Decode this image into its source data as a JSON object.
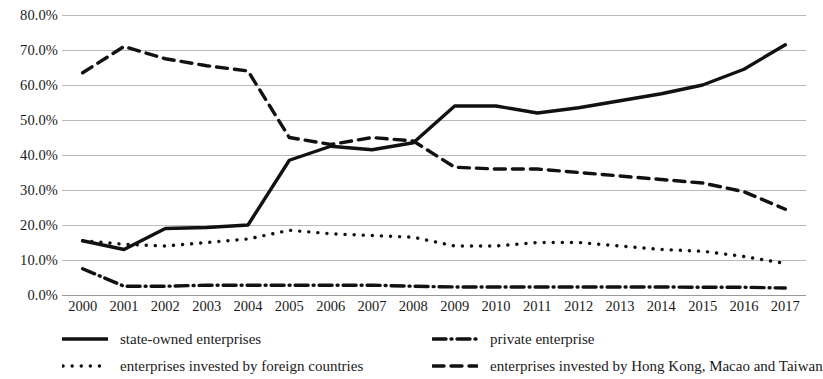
{
  "chart_data": {
    "type": "line",
    "title": "",
    "xlabel": "",
    "ylabel": "",
    "ylim": [
      0,
      80
    ],
    "ytick_step": 10,
    "grid": true,
    "legend_position": "bottom",
    "y_ticks": [
      "0.0%",
      "10.0%",
      "20.0%",
      "30.0%",
      "40.0%",
      "50.0%",
      "60.0%",
      "70.0%",
      "80.0%"
    ],
    "categories": [
      "2000",
      "2001",
      "2002",
      "2003",
      "2004",
      "2005",
      "2006",
      "2007",
      "2008",
      "2009",
      "2010",
      "2011",
      "2012",
      "2013",
      "2014",
      "2015",
      "2016",
      "2017"
    ],
    "series": [
      {
        "name": "state-owned enterprises",
        "style": "solid",
        "color": "#111111",
        "values": [
          15.5,
          13.0,
          19.0,
          19.3,
          20.0,
          38.5,
          42.5,
          41.5,
          43.5,
          54.0,
          54.0,
          52.0,
          53.5,
          55.5,
          57.5,
          60.0,
          64.5,
          71.5
        ]
      },
      {
        "name": "private enterprise",
        "style": "dash-dot",
        "color": "#111111",
        "values": [
          7.5,
          2.5,
          2.5,
          2.8,
          2.8,
          2.8,
          2.8,
          2.8,
          2.5,
          2.3,
          2.3,
          2.3,
          2.3,
          2.3,
          2.3,
          2.2,
          2.2,
          2.0
        ]
      },
      {
        "name": "enterprises invested by foreign countries",
        "style": "dotted",
        "color": "#111111",
        "values": [
          15.5,
          14.5,
          14.0,
          15.0,
          16.0,
          18.5,
          17.5,
          17.0,
          16.5,
          14.0,
          14.0,
          15.0,
          15.0,
          14.0,
          13.0,
          12.5,
          11.0,
          9.0
        ]
      },
      {
        "name": "enterprises invested by Hong Kong, Macao and Taiwan",
        "style": "dashed",
        "color": "#111111",
        "values": [
          63.5,
          71.0,
          67.5,
          65.5,
          64.0,
          45.0,
          43.0,
          45.0,
          44.0,
          36.5,
          36.0,
          36.0,
          35.0,
          34.0,
          33.0,
          32.0,
          29.5,
          24.5
        ]
      }
    ]
  },
  "legend": {
    "items": [
      {
        "label": "state-owned enterprises",
        "style": "solid"
      },
      {
        "label": "private enterprise",
        "style": "dash-dot"
      },
      {
        "label": "enterprises invested by foreign countries",
        "style": "dotted"
      },
      {
        "label": "enterprises invested by Hong Kong, Macao and Taiwan",
        "style": "dashed"
      }
    ]
  }
}
